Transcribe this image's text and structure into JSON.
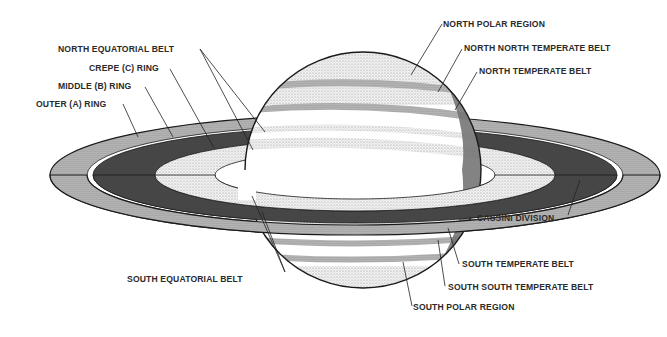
{
  "diagram": {
    "colors": {
      "ink": "#1a1a1a",
      "background": "#ffffff",
      "dark_ring": "#3a3a3a",
      "light_stipple": "#d9d9d9",
      "mid_stipple": "#a8a8a8"
    },
    "labels": {
      "north_equatorial_belt": "NORTH EQUATORIAL BELT",
      "crepe_ring": "CREPE (C) RING",
      "middle_ring": "MIDDLE (B) RING",
      "outer_ring": "OUTER (A) RING",
      "north_polar_region": "NORTH POLAR REGION",
      "north_north_temperate_belt": "NORTH NORTH TEMPERATE BELT",
      "north_temperate_belt": "NORTH TEMPERATE BELT",
      "cassini_division": "CASSINI DIVISION",
      "south_equatorial_belt": "SOUTH EQUATORIAL BELT",
      "south_temperate_belt": "SOUTH TEMPERATE BELT",
      "south_south_temperate_belt": "SOUTH SOUTH TEMPERATE BELT",
      "south_polar_region": "SOUTH POLAR REGION"
    }
  }
}
